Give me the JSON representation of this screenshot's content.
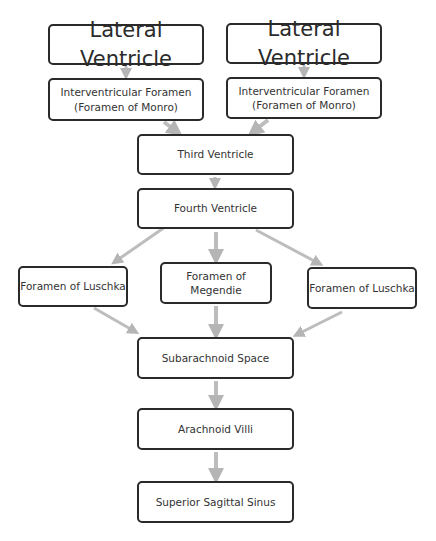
{
  "diagram": {
    "type": "flowchart",
    "arrow_color": "#b5b5b5",
    "nodes": {
      "lateral_ventricle_left": "Lateral Ventricle",
      "lateral_ventricle_right": "Lateral Ventricle",
      "interventricular_left_line1": "Interventricular Foramen",
      "interventricular_left_line2": "(Foramen of Monro)",
      "interventricular_right_line1": "Interventricular Foramen",
      "interventricular_right_line2": "(Foramen of Monro)",
      "third_ventricle": "Third Ventricle",
      "fourth_ventricle": "Fourth Ventricle",
      "luschka_left": "Foramen of Luschka",
      "megendie_line1": "Foramen of",
      "megendie_line2": "Megendie",
      "luschka_right": "Foramen of Luschka",
      "subarachnoid_space": "Subarachnoid Space",
      "arachnoid_villi": "Arachnoid Villi",
      "superior_sagittal_sinus": "Superior Sagittal Sinus"
    },
    "edges": [
      [
        "Lateral Ventricle (left)",
        "Interventricular Foramen (left)"
      ],
      [
        "Lateral Ventricle (right)",
        "Interventricular Foramen (right)"
      ],
      [
        "Interventricular Foramen (left)",
        "Third Ventricle"
      ],
      [
        "Interventricular Foramen (right)",
        "Third Ventricle"
      ],
      [
        "Third Ventricle",
        "Fourth Ventricle"
      ],
      [
        "Fourth Ventricle",
        "Foramen of Luschka (left)"
      ],
      [
        "Fourth Ventricle",
        "Foramen of Megendie"
      ],
      [
        "Fourth Ventricle",
        "Foramen of Luschka (right)"
      ],
      [
        "Foramen of Luschka (left)",
        "Subarachnoid Space"
      ],
      [
        "Foramen of Megendie",
        "Subarachnoid Space"
      ],
      [
        "Foramen of Luschka (right)",
        "Subarachnoid Space"
      ],
      [
        "Subarachnoid Space",
        "Arachnoid Villi"
      ],
      [
        "Arachnoid Villi",
        "Superior Sagittal Sinus"
      ]
    ]
  }
}
